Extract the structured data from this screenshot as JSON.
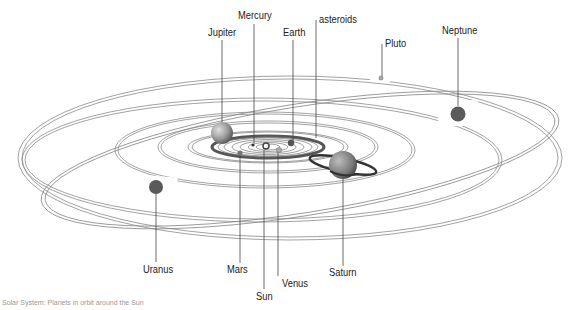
{
  "diagram": {
    "title": "Solar System",
    "caption": "Solar System: Planets in orbit around the Sun",
    "colors": {
      "background": "#ffffff",
      "orbit": "#8a8a8a",
      "planet_dark": "#5a5a5a",
      "planet_light": "#9a9a9a",
      "leader_line": "#444444",
      "label_text": "#222222"
    },
    "labels": {
      "jupiter": "Jupiter",
      "mercury": "Mercury",
      "earth": "Earth",
      "asteroids": "asteroids",
      "pluto": "Pluto",
      "neptune": "Neptune",
      "uranus": "Uranus",
      "mars": "Mars",
      "sun": "Sun",
      "venus": "Venus",
      "saturn": "Saturn"
    }
  }
}
